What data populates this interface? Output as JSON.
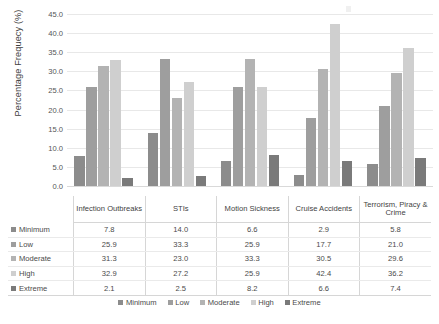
{
  "chart_data": {
    "type": "bar",
    "title": "",
    "xlabel": "",
    "ylabel": "Percentage Frequecy (%)",
    "ylim": [
      0,
      45
    ],
    "ytick_step": 5,
    "yticks": [
      "45.0",
      "40.0",
      "35.0",
      "30.0",
      "25.0",
      "20.0",
      "15.0",
      "10.0",
      "5.0",
      "0.0"
    ],
    "grid": true,
    "legend_position": "bottom",
    "categories": [
      "Infection Outbreaks",
      "STIs",
      "Motion Sickness",
      "Cruise Accidents",
      "Terrorism, Piracy & Crime"
    ],
    "series": [
      {
        "name": "Minimum",
        "color": "#8c8c8c",
        "values": [
          7.8,
          14.0,
          6.6,
          2.9,
          5.8
        ]
      },
      {
        "name": "Low",
        "color": "#9e9e9e",
        "values": [
          25.9,
          33.3,
          25.9,
          17.7,
          21.0
        ]
      },
      {
        "name": "Moderate",
        "color": "#b3b3b3",
        "values": [
          31.3,
          23.0,
          33.3,
          30.5,
          29.6
        ]
      },
      {
        "name": "High",
        "color": "#cfcfcf",
        "values": [
          32.9,
          27.2,
          25.9,
          42.4,
          36.2
        ]
      },
      {
        "name": "Extreme",
        "color": "#7a7a7a",
        "values": [
          2.1,
          2.5,
          8.2,
          6.6,
          7.4
        ]
      }
    ]
  },
  "table": {
    "column_headers": [
      "",
      "Infection Outbreaks",
      "STIs",
      "Motion Sickness",
      "Cruise Accidents",
      "Terrorism, Piracy & Crime"
    ],
    "rows": [
      {
        "label": "Minimum",
        "values": [
          "7.8",
          "14.0",
          "6.6",
          "2.9",
          "5.8"
        ]
      },
      {
        "label": "Low",
        "values": [
          "25.9",
          "33.3",
          "25.9",
          "17.7",
          "21.0"
        ]
      },
      {
        "label": "Moderate",
        "values": [
          "31.3",
          "23.0",
          "33.3",
          "30.5",
          "29.6"
        ]
      },
      {
        "label": "High",
        "values": [
          "32.9",
          "27.2",
          "25.9",
          "42.4",
          "36.2"
        ]
      },
      {
        "label": "Extreme",
        "values": [
          "2.1",
          "2.5",
          "8.2",
          "6.6",
          "7.4"
        ]
      }
    ]
  },
  "legend": {
    "items": [
      "Minimum",
      "Low",
      "Moderate",
      "High",
      "Extreme"
    ]
  }
}
